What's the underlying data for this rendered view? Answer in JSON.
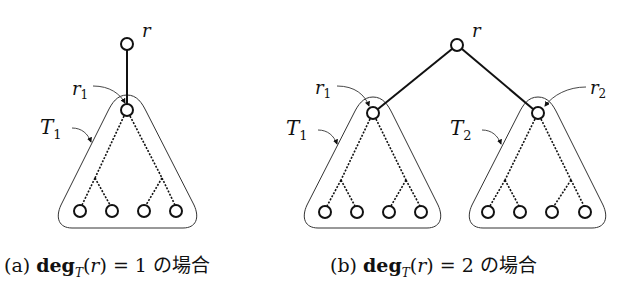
{
  "figure": {
    "subfigures": [
      {
        "id": "a",
        "caption": {
          "label": "(a)",
          "func": "deg",
          "sub": "T",
          "arg_open": "(",
          "arg": "r",
          "arg_close": ")",
          "eq": "= 1",
          "jp": "の場合"
        },
        "labels": {
          "root": "r",
          "child1": "r",
          "child1_sub": "1",
          "subtree1": "T",
          "subtree1_sub": "1"
        }
      },
      {
        "id": "b",
        "caption": {
          "label": "(b)",
          "func": "deg",
          "sub": "T",
          "arg_open": "(",
          "arg": "r",
          "arg_close": ")",
          "eq": "= 2",
          "jp": "の場合"
        },
        "labels": {
          "root": "r",
          "child1": "r",
          "child1_sub": "1",
          "child2": "r",
          "child2_sub": "2",
          "subtree1": "T",
          "subtree1_sub": "1",
          "subtree2": "T",
          "subtree2_sub": "2"
        }
      }
    ],
    "colors": {
      "stroke": "#111111",
      "outline": "#333333",
      "background": "#ffffff"
    }
  }
}
